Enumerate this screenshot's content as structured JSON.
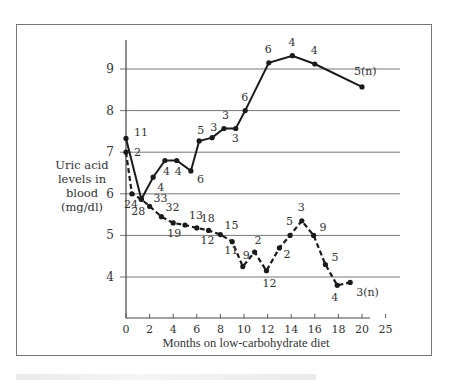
{
  "chart_data": {
    "type": "line",
    "title": "",
    "xlabel": "Months on low-carbohydrate diet",
    "ylabel": "Uric acid levels in blood (mg/dl)",
    "xlim": [
      0,
      25
    ],
    "ylim": [
      3.2,
      9.7
    ],
    "x_ticks": [
      0,
      2,
      4,
      6,
      8,
      10,
      12,
      14,
      16,
      18,
      20,
      25
    ],
    "x_tick_labels": [
      "0",
      "2",
      "4",
      "6",
      "8",
      "10",
      "12",
      "14",
      "16",
      "18",
      "20",
      "25"
    ],
    "y_ticks": [
      4,
      5,
      6,
      7,
      8,
      9
    ],
    "y_tick_labels": [
      "4",
      "5",
      "6",
      "7",
      "8",
      "9"
    ],
    "grid": "horizontal",
    "legend": null,
    "annotation_note": "Numbers beside points denote number of subjects (n)",
    "series": [
      {
        "name": "solid",
        "style": "solid",
        "points": [
          {
            "x": 0,
            "y": 7.33,
            "label": "11"
          },
          {
            "x": 1.3,
            "y": 5.87,
            "label": ""
          },
          {
            "x": 2.3,
            "y": 6.4,
            "label": "4"
          },
          {
            "x": 3.3,
            "y": 6.8,
            "label": "4"
          },
          {
            "x": 4.3,
            "y": 6.8,
            "label": "4"
          },
          {
            "x": 5.5,
            "y": 6.55,
            "label": "6"
          },
          {
            "x": 6.2,
            "y": 7.27,
            "label": "5"
          },
          {
            "x": 7.3,
            "y": 7.35,
            "label": "3"
          },
          {
            "x": 8.3,
            "y": 7.57,
            "label": "3"
          },
          {
            "x": 9.3,
            "y": 7.57,
            "label": "3"
          },
          {
            "x": 10.1,
            "y": 8.0,
            "label": "6"
          },
          {
            "x": 12.1,
            "y": 9.15,
            "label": "6"
          },
          {
            "x": 14.1,
            "y": 9.32,
            "label": "4"
          },
          {
            "x": 16.0,
            "y": 9.12,
            "label": "4"
          },
          {
            "x": 20.0,
            "y": 8.57,
            "label": "5(n)"
          }
        ]
      },
      {
        "name": "dashed",
        "style": "dashed",
        "points": [
          {
            "x": 0,
            "y": 7.0,
            "label": "2"
          },
          {
            "x": 0.5,
            "y": 6.0,
            "label": "24"
          },
          {
            "x": 1.3,
            "y": 5.87,
            "label": "28"
          },
          {
            "x": 2.0,
            "y": 5.7,
            "label": "33"
          },
          {
            "x": 3.0,
            "y": 5.45,
            "label": "32"
          },
          {
            "x": 4.0,
            "y": 5.3,
            "label": "19"
          },
          {
            "x": 5.0,
            "y": 5.25,
            "label": "13"
          },
          {
            "x": 6.0,
            "y": 5.18,
            "label": "18"
          },
          {
            "x": 7.0,
            "y": 5.12,
            "label": "12"
          },
          {
            "x": 8.0,
            "y": 5.02,
            "label": "15"
          },
          {
            "x": 9.0,
            "y": 4.85,
            "label": "11"
          },
          {
            "x": 9.9,
            "y": 4.25,
            "label": "9"
          },
          {
            "x": 10.9,
            "y": 4.6,
            "label": "2"
          },
          {
            "x": 11.9,
            "y": 4.15,
            "label": "12"
          },
          {
            "x": 13.0,
            "y": 4.7,
            "label": "2"
          },
          {
            "x": 13.9,
            "y": 5.0,
            "label": "5"
          },
          {
            "x": 14.9,
            "y": 5.35,
            "label": "3"
          },
          {
            "x": 15.9,
            "y": 5.0,
            "label": "9"
          },
          {
            "x": 16.9,
            "y": 4.3,
            "label": "5"
          },
          {
            "x": 17.9,
            "y": 3.8,
            "label": "4"
          },
          {
            "x": 19.0,
            "y": 3.87,
            "label": "3(n)"
          }
        ]
      }
    ]
  },
  "labels": {
    "ylabel_lines": [
      "Uric acid",
      "levels in",
      "blood",
      "(mg/dl)"
    ],
    "xlabel": "Months on low-carbohydrate diet"
  }
}
